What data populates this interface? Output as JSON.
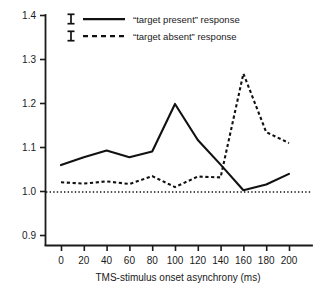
{
  "chart_data": {
    "type": "line",
    "title": "",
    "xlabel": "TMS-stimulus onset asynchrony (ms)",
    "ylabel": "",
    "x": [
      0,
      20,
      40,
      60,
      80,
      100,
      120,
      140,
      160,
      180,
      200
    ],
    "xlim": [
      -12,
      212
    ],
    "ylim": [
      0.9,
      1.4
    ],
    "xticks": [
      0,
      20,
      40,
      60,
      80,
      100,
      120,
      140,
      160,
      180,
      200
    ],
    "xtick_labels": [
      "0",
      "20",
      "40",
      "60",
      "80",
      "100",
      "120",
      "140",
      "160",
      "180",
      "200"
    ],
    "yticks": [
      0.9,
      1.0,
      1.1,
      1.2,
      1.3,
      1.4
    ],
    "ytick_labels": [
      "0.9",
      "1.0",
      "1.1",
      "1.2",
      "1.3",
      "1.4"
    ],
    "grid": false,
    "legend_position": "top-left",
    "reference_line": {
      "name": "baseline",
      "value": 1.0,
      "style": "dotted"
    },
    "series": [
      {
        "name": "“target present” response",
        "style": "solid",
        "values": [
          1.06,
          1.078,
          1.093,
          1.078,
          1.091,
          1.199,
          1.117,
          1.061,
          1.003,
          1.016,
          1.04
        ]
      },
      {
        "name": "“target absent” response",
        "style": "dashed",
        "values": [
          1.021,
          1.018,
          1.023,
          1.017,
          1.035,
          1.01,
          1.034,
          1.032,
          1.268,
          1.135,
          1.11
        ]
      }
    ]
  },
  "legend": {
    "entries": [
      {
        "marker": "error-bar-icon",
        "sample": "solid-line-sample",
        "label": "“target present” response"
      },
      {
        "marker": "error-bar-icon",
        "sample": "dashed-line-sample",
        "label": "“target absent” response"
      }
    ]
  },
  "colors": {
    "ink": "#111111",
    "background": "#ffffff"
  }
}
